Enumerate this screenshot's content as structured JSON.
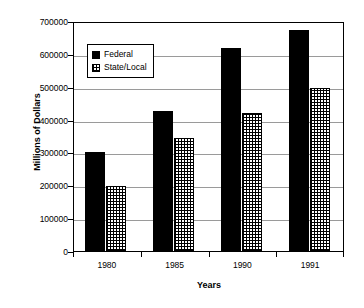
{
  "chart_data": {
    "type": "bar",
    "title": "",
    "xlabel": "Years",
    "ylabel": "Millions of Dollars",
    "categories": [
      "1980",
      "1985",
      "1990",
      "1991"
    ],
    "series": [
      {
        "name": "Federal",
        "values": [
          300000,
          425000,
          617000,
          672000
        ]
      },
      {
        "name": "State/Local",
        "values": [
          197000,
          345000,
          421000,
          497000
        ]
      }
    ],
    "ylim": [
      0,
      700000
    ],
    "ytick_values": [
      0,
      100000,
      200000,
      300000,
      400000,
      500000,
      600000,
      700000
    ],
    "ytick_labels": [
      "0",
      "100000",
      "200000",
      "300000",
      "400000",
      "500000",
      "600000",
      "700000"
    ],
    "grid": true,
    "grid_axis": "y",
    "legend_position": "upper left",
    "legend": [
      {
        "label": "Federal",
        "swatch": "solid-black-square"
      },
      {
        "label": "State/Local",
        "swatch": "crosshatch-square"
      }
    ],
    "colors": {
      "federal": "#000000",
      "state_local_fill": "#ffffff",
      "state_local_pattern": "#000000",
      "gridline": "#9a9a9a",
      "axis": "#000000",
      "background": "#ffffff"
    }
  }
}
